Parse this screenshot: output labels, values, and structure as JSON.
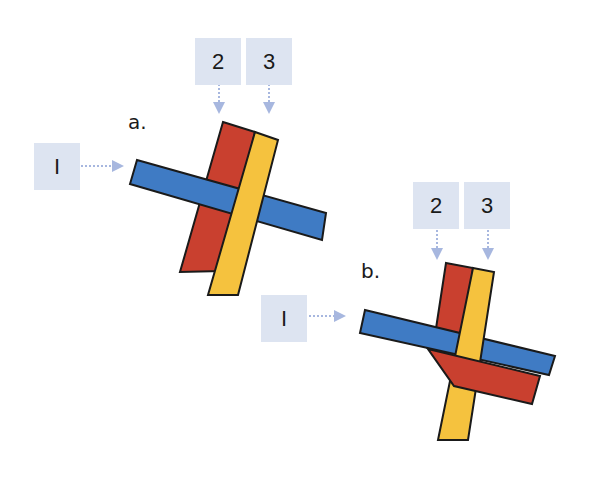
{
  "diagram": {
    "colors": {
      "label_bg": "#dde4f1",
      "arrow": "#a7b7df",
      "strand_1": "#3f7bc4",
      "strand_2": "#c9402f",
      "strand_3": "#f5c23e",
      "outline": "#1a1a1a"
    },
    "panel_a": {
      "step_label": "a.",
      "labels": {
        "strand_1": "I",
        "strand_2": "2",
        "strand_3": "3"
      }
    },
    "panel_b": {
      "step_label": "b.",
      "labels": {
        "strand_1": "I",
        "strand_2": "2",
        "strand_3": "3"
      }
    }
  }
}
